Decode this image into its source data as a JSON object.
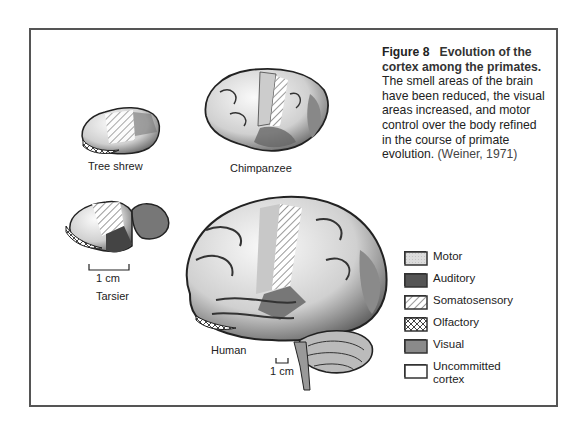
{
  "figure": {
    "number": "Figure 8",
    "title": "Evolution of the cortex among the primates.",
    "title_line1": "Evolution of the",
    "title_line2": "cortex among the primates.",
    "body_lines": [
      "The smell areas of the brain",
      "have been reduced, the visual",
      "areas increased, and motor",
      "control over the body refined",
      "in the course of primate",
      "evolution."
    ],
    "citation": "(Weiner, 1971)"
  },
  "brains": [
    {
      "name": "Tree shrew",
      "label": "Tree shrew"
    },
    {
      "name": "Chimpanzee",
      "label": "Chimpanzee"
    },
    {
      "name": "Tarsier",
      "label": "Tarsier",
      "scale": "1 cm"
    },
    {
      "name": "Human",
      "label": "Human",
      "scale": "1 cm"
    }
  ],
  "legend": [
    {
      "label": "Motor",
      "pattern": "light-dotted",
      "color": "#d8d8d8"
    },
    {
      "label": "Auditory",
      "pattern": "dark",
      "color": "#555555"
    },
    {
      "label": "Somatosensory",
      "pattern": "diagonal-hatch",
      "color": "#ffffff"
    },
    {
      "label": "Olfactory",
      "pattern": "cross-hatch",
      "color": "#ffffff"
    },
    {
      "label": "Visual",
      "pattern": "medium",
      "color": "#8a8a8a"
    },
    {
      "label": "Uncommitted",
      "label2": "cortex",
      "pattern": "blank",
      "color": "#ffffff"
    }
  ]
}
